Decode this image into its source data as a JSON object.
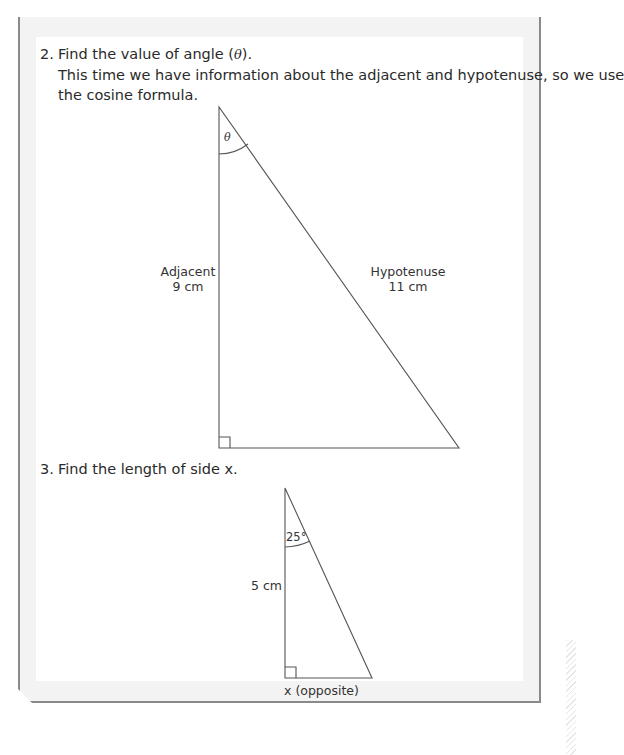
{
  "questions": [
    {
      "number": "2.",
      "prompt_prefix": "Find the value of angle (",
      "prompt_symbol": "θ",
      "prompt_suffix": ").",
      "explanation_line1": "This time we have information about the adjacent and hypotenuse, so we use",
      "explanation_line2": "the cosine formula.",
      "diagram": {
        "angle_label": "θ",
        "adjacent_label": "Adjacent",
        "adjacent_value": "9 cm",
        "hypotenuse_label": "Hypotenuse",
        "hypotenuse_value": "11 cm",
        "right_angle_marker": true
      }
    },
    {
      "number": "3.",
      "prompt_prefix": "Find the length of side ",
      "prompt_symbol": "x",
      "prompt_suffix": ".",
      "diagram": {
        "angle_label": "25°",
        "side_label": "5 cm",
        "opposite_symbol": "x",
        "opposite_label": " (opposite)",
        "right_angle_marker": true
      }
    }
  ],
  "colors": {
    "frame_border": "#8a8a8a",
    "frame_fill": "#f3f3f3",
    "text": "#2a2a2a",
    "line": "#555555"
  }
}
